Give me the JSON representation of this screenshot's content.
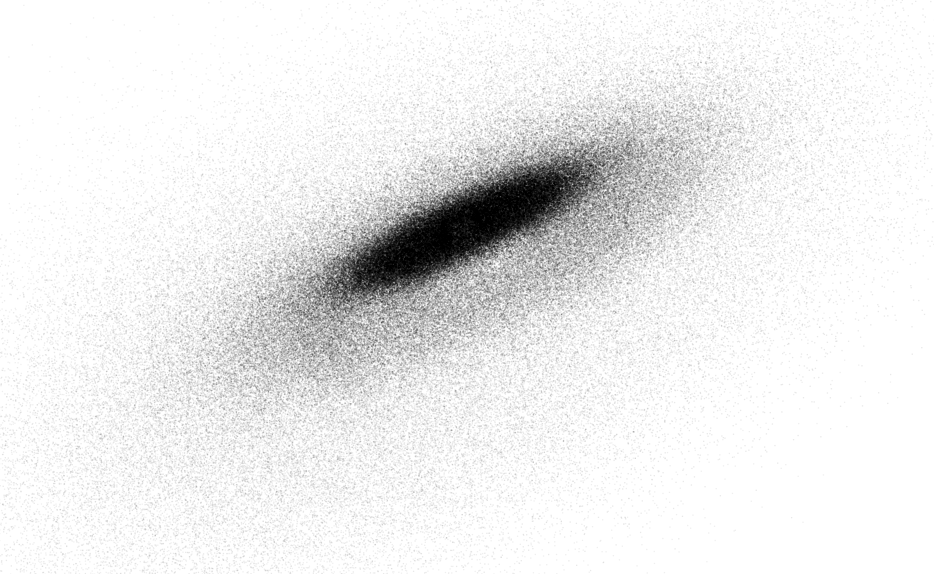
{
  "figure": {
    "width": 934,
    "height": 574,
    "background_color": "#ffffff",
    "has_axes": false,
    "has_frame": false,
    "has_legend": false,
    "has_title": false,
    "has_tick_labels": false,
    "title": "",
    "subtitle": "",
    "xlabel": "",
    "ylabel": ""
  },
  "chart_data": {
    "type": "scatter",
    "title": "",
    "subtitle": "",
    "xlabel": "",
    "ylabel": "",
    "grid": false,
    "legend_position": "none",
    "axes_visible": false,
    "tick_labels": [],
    "annotations": [],
    "colormap": "grayscale",
    "point_color": "#000000",
    "point_size_px": 1.35,
    "point_alpha": 0.16,
    "background_color": "#ffffff",
    "n_points": 260000,
    "xlim": [
      0,
      934
    ],
    "ylim": [
      0,
      574
    ],
    "series": [
      {
        "name": "inner-ring-core",
        "component": "ring",
        "n_points": 74000,
        "center": [
          462,
          228
        ],
        "radius_mean": 86,
        "radius_sigma": 40,
        "inner_cut": 16,
        "rotation_deg": -25,
        "inclination_squash": 0.215,
        "thickness_sigma": 7.0,
        "alpha": 0.2,
        "gray_level": "#1e1e1e"
      },
      {
        "name": "mid-annulus",
        "component": "ring",
        "n_points": 82000,
        "center": [
          470,
          248
        ],
        "radius_mean": 182,
        "radius_sigma": 74,
        "inner_cut": 60,
        "rotation_deg": -25,
        "inclination_squash": 0.315,
        "thickness_sigma": 15.0,
        "alpha": 0.13,
        "gray_level": "#6e6e6e"
      },
      {
        "name": "outer-halo",
        "component": "ring",
        "n_points": 72000,
        "center": [
          452,
          282
        ],
        "radius_mean": 300,
        "radius_sigma": 118,
        "inner_cut": 130,
        "rotation_deg": -26,
        "inclination_squash": 0.46,
        "thickness_sigma": 30.0,
        "alpha": 0.085,
        "gray_level": "#b4b4b4"
      },
      {
        "name": "lower-left-diffuse-extension",
        "component": "plume",
        "n_points": 32000,
        "center": [
          300,
          380
        ],
        "radius_mean": 250,
        "radius_sigma": 135,
        "inner_cut": 40,
        "rotation_deg": -27,
        "inclination_squash": 0.62,
        "thickness_sigma": 46.0,
        "alpha": 0.062,
        "gray_level": "#cfcfcf"
      }
    ],
    "density_profile": {
      "peak_darkness_hex": "#222222",
      "mid_darkness_hex": "#808080",
      "halo_darkness_hex": "#dcdcdc",
      "falloff": "gaussian-radial"
    }
  },
  "render": {
    "seed": 20240917,
    "blend": "source-over",
    "antialias": false
  }
}
